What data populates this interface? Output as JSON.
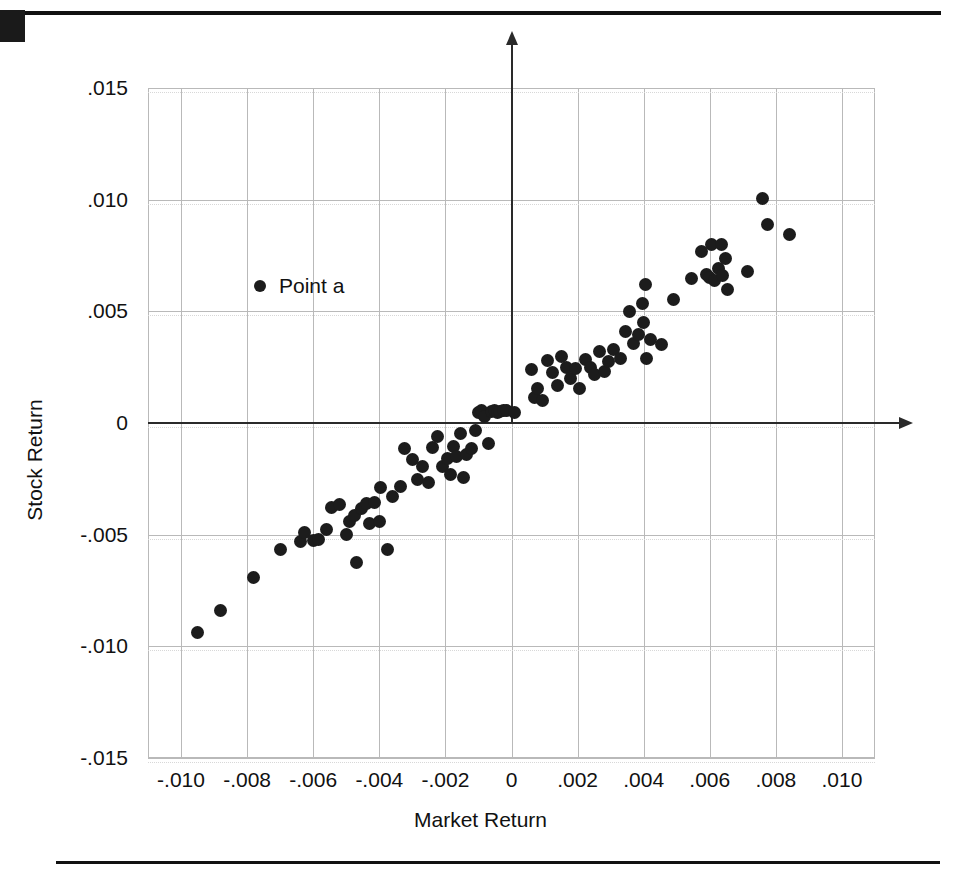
{
  "chart_data": {
    "type": "scatter",
    "title": "",
    "xlabel": "Market Return",
    "ylabel": "Stock Return",
    "xlim": [
      -0.011,
      0.011
    ],
    "ylim": [
      -0.015,
      0.015
    ],
    "xticks": [
      "-.010",
      "-.008",
      "-.006",
      "-.004",
      "-.002",
      "0",
      ".002",
      ".004",
      ".006",
      ".008",
      ".010"
    ],
    "xtick_values": [
      -0.01,
      -0.008,
      -0.006,
      -0.004,
      -0.002,
      0,
      0.002,
      0.004,
      0.006,
      0.008,
      0.01
    ],
    "yticks": [
      ".015",
      ".010",
      ".005",
      "0",
      "-.005",
      "-.010",
      "-.015"
    ],
    "ytick_values": [
      0.015,
      0.01,
      0.005,
      0,
      -0.005,
      -0.01,
      -0.015
    ],
    "grid": true,
    "grid_color": "#b9b9b9",
    "marker_color": "#1c1c1c",
    "axis_color": "#2a2a2a",
    "legend": {
      "position": "inside-upper-left",
      "entries": [
        {
          "label": "Point a",
          "marker": "filled-circle",
          "color": "#1c1c1c"
        }
      ]
    },
    "points": [
      {
        "x": -0.0095,
        "y": -0.0094
      },
      {
        "x": -0.0088,
        "y": -0.0084
      },
      {
        "x": -0.0078,
        "y": -0.0069
      },
      {
        "x": -0.007,
        "y": -0.00565
      },
      {
        "x": -0.0064,
        "y": -0.0053
      },
      {
        "x": -0.00625,
        "y": -0.0049
      },
      {
        "x": -0.006,
        "y": -0.00525
      },
      {
        "x": -0.00585,
        "y": -0.0052
      },
      {
        "x": -0.0056,
        "y": -0.00475
      },
      {
        "x": -0.00545,
        "y": -0.0038
      },
      {
        "x": -0.0052,
        "y": -0.00365
      },
      {
        "x": -0.005,
        "y": -0.005
      },
      {
        "x": -0.0049,
        "y": -0.0044
      },
      {
        "x": -0.00475,
        "y": -0.00415
      },
      {
        "x": -0.0047,
        "y": -0.00625
      },
      {
        "x": -0.00455,
        "y": -0.00385
      },
      {
        "x": -0.0044,
        "y": -0.0036
      },
      {
        "x": -0.0043,
        "y": -0.0045
      },
      {
        "x": -0.00415,
        "y": -0.00355
      },
      {
        "x": -0.004,
        "y": -0.0044
      },
      {
        "x": -0.00395,
        "y": -0.0029
      },
      {
        "x": -0.00375,
        "y": -0.00565
      },
      {
        "x": -0.0036,
        "y": -0.0033
      },
      {
        "x": -0.00335,
        "y": -0.00285
      },
      {
        "x": -0.00325,
        "y": -0.00115
      },
      {
        "x": -0.003,
        "y": -0.00165
      },
      {
        "x": -0.00285,
        "y": -0.00255
      },
      {
        "x": -0.0027,
        "y": -0.00195
      },
      {
        "x": -0.0025,
        "y": -0.00265
      },
      {
        "x": -0.0024,
        "y": -0.0011
      },
      {
        "x": -0.00225,
        "y": -0.0006
      },
      {
        "x": -0.0021,
        "y": -0.00195
      },
      {
        "x": -0.00195,
        "y": -0.0016
      },
      {
        "x": -0.00185,
        "y": -0.0023
      },
      {
        "x": -0.00175,
        "y": -0.00105
      },
      {
        "x": -0.00165,
        "y": -0.0015
      },
      {
        "x": -0.00155,
        "y": -0.00045
      },
      {
        "x": -0.00145,
        "y": -0.00245
      },
      {
        "x": -0.00135,
        "y": -0.0014
      },
      {
        "x": -0.0012,
        "y": -0.00115
      },
      {
        "x": -0.0011,
        "y": -0.00035
      },
      {
        "x": -0.001,
        "y": 0.00045
      },
      {
        "x": -0.0009,
        "y": 0.00055
      },
      {
        "x": -0.00082,
        "y": 0.0003
      },
      {
        "x": -0.0007,
        "y": -0.0009
      },
      {
        "x": -0.0006,
        "y": 0.0005
      },
      {
        "x": -0.0005,
        "y": 0.00055
      },
      {
        "x": -0.00042,
        "y": 0.00045
      },
      {
        "x": -0.00035,
        "y": 0.0005
      },
      {
        "x": -0.00025,
        "y": 0.00055
      },
      {
        "x": -0.00015,
        "y": 0.00055
      },
      {
        "x": 8e-05,
        "y": 0.00045
      },
      {
        "x": 0.0006,
        "y": 0.0024
      },
      {
        "x": 0.0007,
        "y": 0.00115
      },
      {
        "x": 0.0008,
        "y": 0.00155
      },
      {
        "x": 0.00095,
        "y": 0.001
      },
      {
        "x": 0.0011,
        "y": 0.0028
      },
      {
        "x": 0.00125,
        "y": 0.00225
      },
      {
        "x": 0.0014,
        "y": 0.0017
      },
      {
        "x": 0.0015,
        "y": 0.003
      },
      {
        "x": 0.00165,
        "y": 0.0025
      },
      {
        "x": 0.0018,
        "y": 0.002
      },
      {
        "x": 0.00195,
        "y": 0.00245
      },
      {
        "x": 0.00205,
        "y": 0.00155
      },
      {
        "x": 0.00225,
        "y": 0.00285
      },
      {
        "x": 0.0024,
        "y": 0.0025
      },
      {
        "x": 0.0025,
        "y": 0.00215
      },
      {
        "x": 0.00265,
        "y": 0.0032
      },
      {
        "x": 0.0028,
        "y": 0.0023
      },
      {
        "x": 0.00295,
        "y": 0.00275
      },
      {
        "x": 0.0031,
        "y": 0.0033
      },
      {
        "x": 0.0033,
        "y": 0.0029
      },
      {
        "x": 0.00345,
        "y": 0.0041
      },
      {
        "x": 0.00358,
        "y": 0.005
      },
      {
        "x": 0.00368,
        "y": 0.00355
      },
      {
        "x": 0.00385,
        "y": 0.00395
      },
      {
        "x": 0.00395,
        "y": 0.00535
      },
      {
        "x": 0.004,
        "y": 0.0045
      },
      {
        "x": 0.00405,
        "y": 0.0062
      },
      {
        "x": 0.0041,
        "y": 0.0029
      },
      {
        "x": 0.0042,
        "y": 0.00375
      },
      {
        "x": 0.00455,
        "y": 0.0035
      },
      {
        "x": 0.0049,
        "y": 0.00555
      },
      {
        "x": 0.00545,
        "y": 0.00645
      },
      {
        "x": 0.00575,
        "y": 0.0077
      },
      {
        "x": 0.0059,
        "y": 0.00665
      },
      {
        "x": 0.006,
        "y": 0.0065
      },
      {
        "x": 0.00605,
        "y": 0.008
      },
      {
        "x": 0.00615,
        "y": 0.0064
      },
      {
        "x": 0.00625,
        "y": 0.0069
      },
      {
        "x": 0.00635,
        "y": 0.008
      },
      {
        "x": 0.0064,
        "y": 0.0066
      },
      {
        "x": 0.00648,
        "y": 0.00735
      },
      {
        "x": 0.00655,
        "y": 0.006
      },
      {
        "x": 0.00715,
        "y": 0.0068
      },
      {
        "x": 0.0076,
        "y": 0.01005
      },
      {
        "x": 0.00775,
        "y": 0.0089
      },
      {
        "x": 0.0084,
        "y": 0.00845
      }
    ]
  }
}
